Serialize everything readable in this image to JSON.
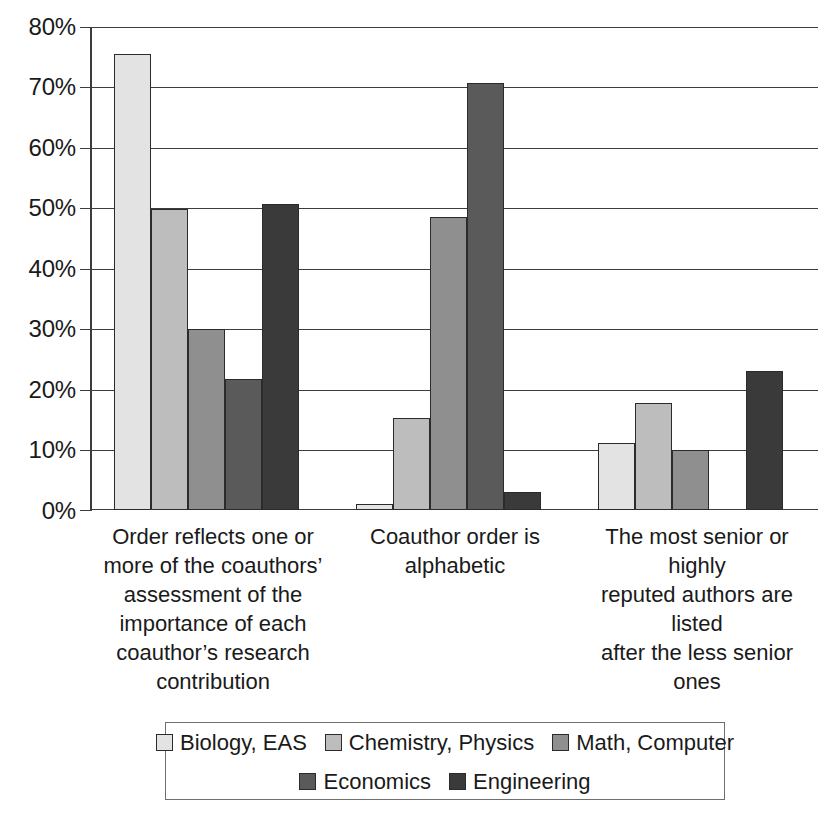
{
  "chart_data": {
    "type": "bar",
    "title": "",
    "subtitle": "",
    "xlabel": "",
    "ylabel": "",
    "ylim": [
      0,
      80
    ],
    "y_tick_labels": [
      "80%",
      "70%",
      "60%",
      "50%",
      "40%",
      "30%",
      "20%",
      "10%",
      "0%"
    ],
    "y_tick_values": [
      80,
      70,
      60,
      50,
      40,
      30,
      20,
      10,
      0
    ],
    "grid": true,
    "legend_position": "bottom",
    "categories": [
      "Order reflects one or more of the coauthors’ assessment of the importance of each coauthor’s research contribution",
      "Coauthor order is alphabetic",
      "The most senior or highly reputed authors are listed after the less senior ones"
    ],
    "category_lines": [
      [
        "Order reflects one or",
        "more of the coauthors’",
        "assessment of the",
        "importance of each",
        "coauthor’s research",
        "contribution"
      ],
      [
        "Coauthor order is",
        "alphabetic"
      ],
      [
        "The most senior or highly",
        "reputed authors are listed",
        "after the less senior ones"
      ]
    ],
    "series": [
      {
        "name": "Biology, EAS",
        "color": "#e3e3e3",
        "values": [
          75.7,
          1.0,
          11.2
        ]
      },
      {
        "name": "Chemistry, Physics",
        "color": "#bdbdbd",
        "values": [
          50.0,
          15.2,
          17.8
        ]
      },
      {
        "name": "Math, Computer",
        "color": "#8f8f8f",
        "values": [
          30.0,
          48.6,
          10.0
        ]
      },
      {
        "name": "Economics",
        "color": "#5a5a5a",
        "values": [
          21.7,
          70.8,
          0.0
        ]
      },
      {
        "name": "Engineering",
        "color": "#3a3a3a",
        "values": [
          50.8,
          3.0,
          23.0
        ]
      }
    ]
  },
  "legend": {
    "row1": [
      "Biology, EAS",
      "Chemistry, Physics",
      "Math, Computer"
    ],
    "row2": [
      "Economics",
      "Engineering"
    ]
  },
  "axis": {
    "t80": "80%",
    "t70": "70%",
    "t60": "60%",
    "t50": "50%",
    "t40": "40%",
    "t30": "30%",
    "t20": "20%",
    "t10": "10%",
    "t0": "0%"
  },
  "categories_text": {
    "c0_l0": "Order reflects one or",
    "c0_l1": "more of the coauthors’",
    "c0_l2": "assessment of the",
    "c0_l3": "importance of each",
    "c0_l4": "coauthor’s research",
    "c0_l5": "contribution",
    "c1_l0": "Coauthor order is",
    "c1_l1": "alphabetic",
    "c2_l0": "The most senior or highly",
    "c2_l1": "reputed authors are listed",
    "c2_l2": "after the less senior ones"
  },
  "legend_text": {
    "i0": "Biology, EAS",
    "i1": "Chemistry, Physics",
    "i2": "Math, Computer",
    "i3": "Economics",
    "i4": "Engineering"
  }
}
